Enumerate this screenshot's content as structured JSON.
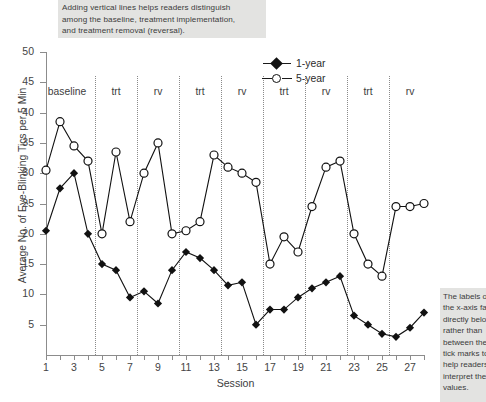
{
  "annotations": {
    "top_note": [
      "Adding vertical lines helps readers distinguish",
      "among the baseline, treatment implementation,",
      "and treatment removal (reversal)."
    ],
    "right_note": [
      "The labels on",
      "the x-axis fall",
      "directly below",
      "rather than",
      "between the",
      "tick marks to",
      "help readers",
      "interpret the",
      "values."
    ]
  },
  "chart_data": {
    "type": "line",
    "title": "",
    "xlabel": "Session",
    "ylabel": "Average No. of Eye-Blinking Tics per 5 Min",
    "xlim": [
      1,
      28
    ],
    "ylim": [
      0,
      50
    ],
    "yticks": [
      5,
      10,
      15,
      20,
      25,
      30,
      35,
      40,
      45,
      50
    ],
    "xticks": [
      1,
      2,
      3,
      4,
      5,
      6,
      7,
      8,
      9,
      10,
      11,
      12,
      13,
      14,
      15,
      16,
      17,
      18,
      19,
      20,
      21,
      22,
      23,
      24,
      25,
      26,
      27,
      28
    ],
    "xtick_labels": [
      "1",
      "",
      "3",
      "",
      "5",
      "",
      "7",
      "",
      "9",
      "",
      "11",
      "",
      "13",
      "",
      "15",
      "",
      "17",
      "",
      "19",
      "",
      "21",
      "",
      "23",
      "",
      "25",
      "",
      "27",
      ""
    ],
    "grid": false,
    "legend_position": "top-center",
    "x": [
      1,
      2,
      3,
      4,
      5,
      6,
      7,
      8,
      9,
      10,
      11,
      12,
      13,
      14,
      15,
      16,
      17,
      18,
      19,
      20,
      21,
      22,
      23,
      24,
      25,
      26,
      27,
      28
    ],
    "series": [
      {
        "name": "1-year",
        "marker": "filled-diamond",
        "values": [
          20.5,
          27.5,
          30.0,
          20.0,
          15.0,
          14.0,
          9.5,
          10.5,
          8.5,
          14.0,
          17.0,
          16.0,
          14.0,
          11.5,
          12.0,
          5.0,
          7.5,
          7.5,
          9.5,
          11.0,
          12.0,
          13.0,
          6.5,
          5.0,
          3.5,
          3.0,
          4.5,
          7.0
        ]
      },
      {
        "name": "5-year",
        "marker": "open-circle",
        "values": [
          30.5,
          38.5,
          34.5,
          32.0,
          20.0,
          33.5,
          22.0,
          30.0,
          35.0,
          20.0,
          20.5,
          22.0,
          33.0,
          31.0,
          30.0,
          28.5,
          15.0,
          19.5,
          17.0,
          24.5,
          31.0,
          32.0,
          20.0,
          15.0,
          13.0,
          24.5,
          24.5,
          25.0
        ]
      }
    ],
    "phases": [
      {
        "label": "baseline",
        "start": 1,
        "end": 4
      },
      {
        "label": "trt",
        "start": 5,
        "end": 7
      },
      {
        "label": "rv",
        "start": 8,
        "end": 10
      },
      {
        "label": "trt",
        "start": 11,
        "end": 13
      },
      {
        "label": "rv",
        "start": 14,
        "end": 16
      },
      {
        "label": "trt",
        "start": 17,
        "end": 19
      },
      {
        "label": "rv",
        "start": 20,
        "end": 22
      },
      {
        "label": "trt",
        "start": 23,
        "end": 25
      },
      {
        "label": "rv",
        "start": 26,
        "end": 28
      }
    ],
    "dividers": [
      4.5,
      7.5,
      10.5,
      13.5,
      16.5,
      19.5,
      22.5,
      25.5
    ],
    "colors": {
      "series_line": "#111111",
      "axis": "#8c8c8c",
      "divider": "#8a8a8a",
      "note_background": "#e3e3e1",
      "text": "#3d3d3d"
    }
  }
}
